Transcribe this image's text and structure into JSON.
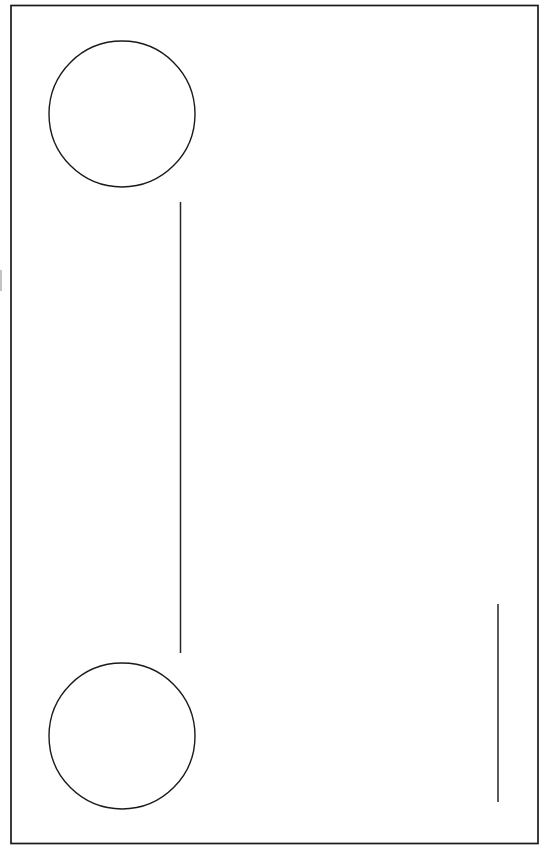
{
  "document": {
    "title": "Untitled Line Drawing",
    "kind": "scanned-line-drawing",
    "background_color": "#ffffff",
    "ink_color": "#1a1a1a",
    "width": 547,
    "height": 852,
    "visible_text": "",
    "text_elements": []
  },
  "canvas": {
    "name": "drawing-canvas",
    "background_color": "#ffffff"
  },
  "shapes": {
    "border": {
      "name": "page-border-rectangle",
      "type": "rectangle",
      "x": 11,
      "y": 5.5,
      "width": 527,
      "height": 838,
      "stroke": "#1a1a1a",
      "stroke_width": 1.7,
      "fill": "none"
    },
    "circles": [
      {
        "name": "top-circle",
        "type": "circle",
        "cx": 122,
        "cy": 114,
        "r": 73,
        "stroke": "#1a1a1a",
        "stroke_width": 1.4,
        "fill": "none"
      },
      {
        "name": "bottom-circle",
        "type": "circle",
        "cx": 122,
        "cy": 736,
        "r": 73,
        "stroke": "#1a1a1a",
        "stroke_width": 1.4,
        "fill": "none"
      }
    ],
    "lines": [
      {
        "name": "center-vertical-line",
        "type": "line",
        "x1": 180.5,
        "y1": 202,
        "x2": 180.5,
        "y2": 653,
        "stroke": "#262626",
        "stroke_width": 1.5
      },
      {
        "name": "right-vertical-line",
        "type": "line",
        "x1": 498,
        "y1": 604,
        "x2": 498,
        "y2": 802,
        "stroke": "#262626",
        "stroke_width": 1.5
      }
    ],
    "artifacts": [
      {
        "name": "left-edge-scan-artifact",
        "type": "line",
        "x1": 1,
        "y1": 270,
        "x2": 1,
        "y2": 291,
        "stroke": "#9a9a9a",
        "stroke_width": 1.2
      }
    ]
  }
}
